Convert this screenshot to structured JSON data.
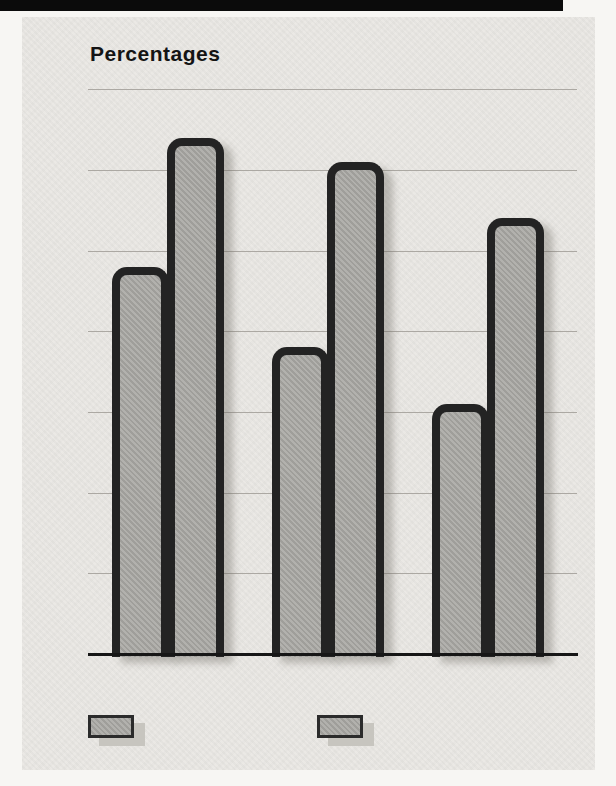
{
  "chart_data": {
    "type": "bar",
    "title": "Percentages",
    "categories": [
      "1972",
      "1992",
      "1996"
    ],
    "series": [
      {
        "name": "18–20 years old",
        "values": [
          48,
          38,
          31
        ]
      },
      {
        "name": "All adults",
        "values": [
          64,
          61,
          54
        ]
      }
    ],
    "xlabel": "",
    "ylabel": "",
    "ylim": [
      0,
      70
    ],
    "yticks": [
      0,
      10,
      20,
      30,
      40,
      50,
      60,
      70
    ],
    "grid": true,
    "legend_position": "bottom-left",
    "colors": {
      "bar_fill": "#a9a8a4",
      "bar_border": "#232323",
      "panel": "#e9e7e3",
      "page_margin": "#f7f6f3",
      "gridline": "#a19d98",
      "axis": "#161616",
      "text": "#1b1b1b",
      "legend_shadow": "#c7c5bf",
      "top_strip": "#0b0b0b"
    }
  }
}
